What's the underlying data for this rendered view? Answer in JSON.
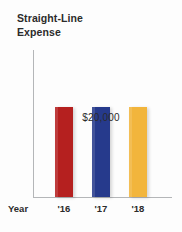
{
  "chart_data": {
    "type": "bar",
    "title": "Straight-Line\nExpense",
    "xlabel": "Year",
    "ylabel": "",
    "categories": [
      "'16",
      "'17",
      "'18"
    ],
    "values": [
      20000,
      20000,
      20000
    ],
    "value_labels": [
      "$20,000"
    ],
    "annotation": "$20,000",
    "ylim": [
      0,
      32500
    ],
    "grid": false,
    "legend": "none",
    "series": [
      {
        "name": "Straight-Line Expense",
        "values": [
          20000,
          20000,
          20000
        ],
        "colors": [
          "#b5201f",
          "#263a8c",
          "#f2b53c"
        ]
      }
    ],
    "bars": [
      {
        "category": "'16",
        "value": 20000,
        "color": "#b5201f",
        "name": "bar-2016"
      },
      {
        "category": "'17",
        "value": 20000,
        "color": "#263a8c",
        "name": "bar-2017"
      },
      {
        "category": "'18",
        "value": 20000,
        "color": "#f2b53c",
        "name": "bar-2018"
      }
    ],
    "axis_color": "#b4b6b8",
    "text_color": "#2b2b2b",
    "background": "#fdfdfd"
  }
}
